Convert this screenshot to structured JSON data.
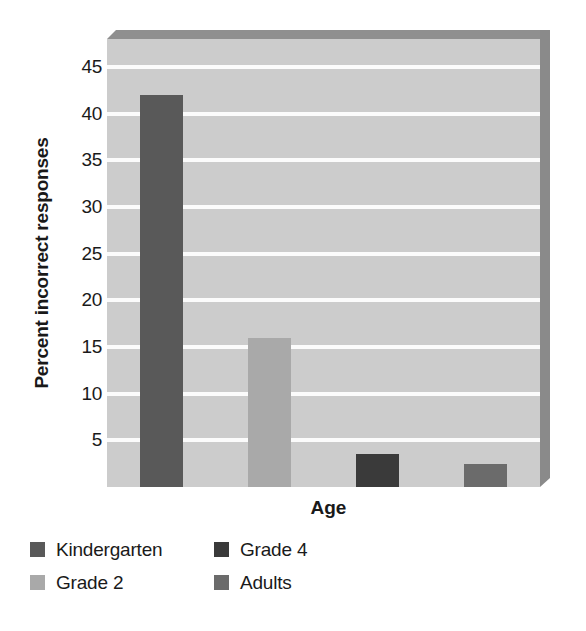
{
  "chart_data": {
    "type": "bar",
    "title": "",
    "xlabel": "Age",
    "ylabel": "Percent incorrect responses",
    "categories": [
      "Kindergarten",
      "Grade 2",
      "Grade 4",
      "Adults"
    ],
    "values": [
      42,
      16,
      3.5,
      2.5
    ],
    "series": [
      {
        "name": "Percent incorrect responses",
        "values": [
          42,
          16,
          3.5,
          2.5
        ]
      }
    ],
    "bar_colors": [
      "#595959",
      "#a9a9a9",
      "#3a3a3a",
      "#6b6b6b"
    ],
    "ylim": [
      0,
      48
    ],
    "yticks": [
      5,
      10,
      15,
      20,
      25,
      30,
      35,
      40,
      45
    ],
    "ytick_labels": [
      "5",
      "10",
      "15",
      "20",
      "25",
      "30",
      "35",
      "40",
      "45"
    ],
    "xticks": [],
    "xtick_labels": [],
    "grid": true,
    "grid_color": "#fbfbfb",
    "plot_background": "#cccccc",
    "figure_background": "#ffffff",
    "legend_position": "bottom-left",
    "legend": [
      {
        "label": "Kindergarten",
        "color": "#595959"
      },
      {
        "label": "Grade 4",
        "color": "#3a3a3a"
      },
      {
        "label": "Grade 2",
        "color": "#a9a9a9"
      },
      {
        "label": "Adults",
        "color": "#6b6b6b"
      }
    ]
  },
  "axes": {
    "y_title": "Percent incorrect responses",
    "x_title": "Age",
    "y_ticks": [
      "45",
      "40",
      "35",
      "30",
      "25",
      "20",
      "15",
      "10",
      "5"
    ]
  },
  "legend": {
    "row1": [
      {
        "label": "Kindergarten",
        "color": "#595959"
      },
      {
        "label": "Grade 4",
        "color": "#3a3a3a"
      }
    ],
    "row2": [
      {
        "label": "Grade 2",
        "color": "#a9a9a9"
      },
      {
        "label": "Adults",
        "color": "#6b6b6b"
      }
    ]
  }
}
